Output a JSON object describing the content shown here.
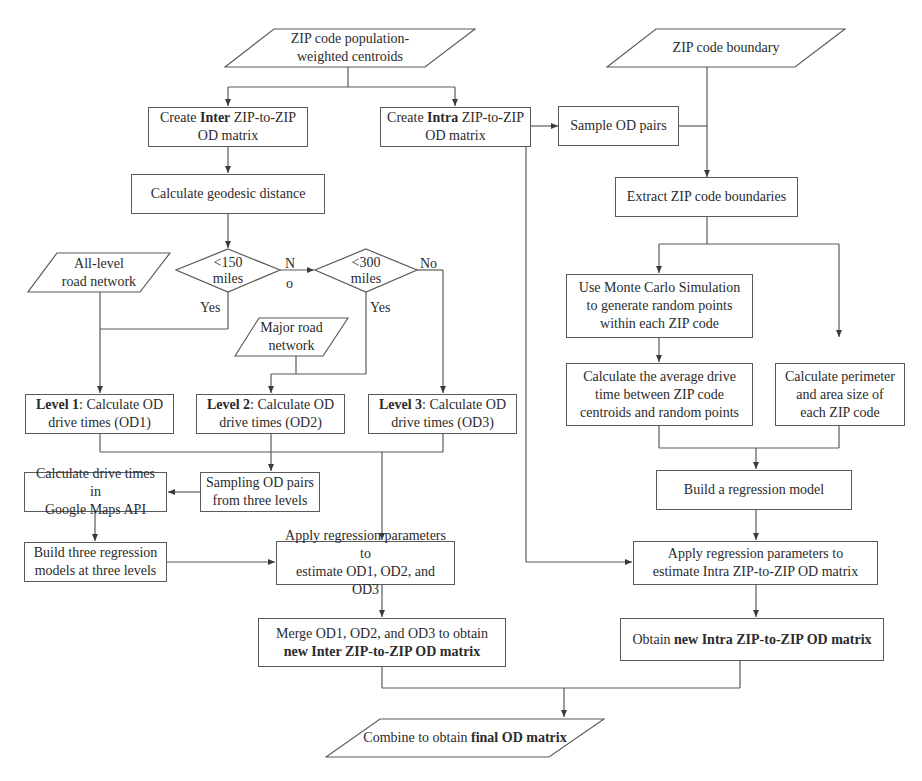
{
  "diagram": {
    "type": "flowchart",
    "inputs": {
      "centroids": {
        "line1": "ZIP code population-",
        "line2": "weighted centroids"
      },
      "boundary": {
        "line1": "ZIP code boundary"
      },
      "all_level_network": {
        "line1": "All-level",
        "line2": "road network"
      },
      "major_road_network": {
        "line1": "Major road",
        "line2": "network"
      }
    },
    "inter_branch": {
      "create": {
        "pre": "Create ",
        "bold": "Inter",
        "post": " ZIP-to-ZIP",
        "line2": "OD matrix"
      },
      "geodesic": {
        "line1": "Calculate geodesic distance"
      },
      "decision1": {
        "line1": "<150",
        "line2": "miles",
        "no_label_1": "N",
        "no_label_2": "o",
        "yes_label": "Yes"
      },
      "decision2": {
        "line1": "<300",
        "line2": "miles",
        "no_label": "No",
        "yes_label": "Yes"
      },
      "level1": {
        "bold": "Level 1",
        "post": ": Calculate OD",
        "line2": "drive times (OD1)"
      },
      "level2": {
        "bold": "Level 2",
        "post": ": Calculate OD",
        "line2": "drive times (OD2)"
      },
      "level3": {
        "bold": "Level 3",
        "post": ": Calculate OD",
        "line2": "drive times (OD3)"
      },
      "google": {
        "line1": "Calculate drive times in",
        "line2": "Google Maps API"
      },
      "sampling": {
        "line1": "Sampling OD pairs",
        "line2": "from three levels"
      },
      "build3": {
        "line1": "Build three regression",
        "line2": "models at three levels"
      },
      "apply": {
        "line1": "Apply regression parameters to",
        "line2": "estimate OD1, OD2, and OD3"
      },
      "merge": {
        "line1": "Merge OD1, OD2, and OD3 to obtain",
        "line2_bold": "new Inter ZIP-to-ZIP OD matrix"
      }
    },
    "intra_branch": {
      "create": {
        "pre": "Create ",
        "bold": "Intra",
        "post": " ZIP-to-ZIP",
        "line2": "OD matrix"
      },
      "sample": {
        "line1": "Sample OD pairs"
      },
      "extract": {
        "line1": "Extract ZIP code boundaries"
      },
      "monte_carlo": {
        "line1": "Use Monte Carlo Simulation",
        "line2": "to generate random points",
        "line3": "within each ZIP code"
      },
      "avg_drive": {
        "line1": "Calculate the average drive",
        "line2": "time between ZIP code",
        "line3": "centroids and random points"
      },
      "perimeter": {
        "line1": "Calculate perimeter",
        "line2": "and area size of",
        "line3": "each ZIP code"
      },
      "build1": {
        "line1": "Build a regression model"
      },
      "apply": {
        "line1": "Apply regression parameters to",
        "line2": "estimate Intra ZIP-to-ZIP OD matrix"
      },
      "obtain": {
        "pre": "Obtain ",
        "bold": "new Intra ZIP-to-ZIP OD matrix"
      }
    },
    "output": {
      "pre": "Combine to obtain ",
      "bold": "final OD matrix"
    },
    "colors": {
      "line": "#5a5a5a",
      "text": "#2b2b2b",
      "background": "#ffffff"
    }
  }
}
